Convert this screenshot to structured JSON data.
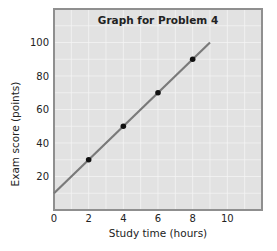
{
  "chart_data": {
    "type": "line",
    "title": "Graph for Problem 4",
    "xlabel": "Study time (hours)",
    "ylabel": "Exam score (points)",
    "xlim": [
      0,
      12
    ],
    "ylim": [
      0,
      120
    ],
    "x_ticks": [
      0,
      2,
      4,
      6,
      8,
      10
    ],
    "y_ticks": [
      20,
      40,
      60,
      80,
      100
    ],
    "grid": true,
    "legend": null,
    "series": [
      {
        "name": "best-fit line",
        "kind": "line",
        "x": [
          0,
          9
        ],
        "y": [
          10,
          100
        ],
        "color": "#7a7a7a"
      },
      {
        "name": "data points",
        "kind": "scatter",
        "x": [
          2,
          4,
          6,
          8
        ],
        "y": [
          30,
          50,
          70,
          90
        ],
        "color": "#111111"
      }
    ]
  },
  "colors": {
    "plot_background": "#e2e2e2",
    "grid": "#f4f4f4",
    "frame": "#8f8f8f",
    "line": "#7a7a7a",
    "points": "#111111"
  }
}
